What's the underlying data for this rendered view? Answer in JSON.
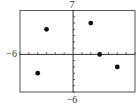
{
  "chart_data": {
    "type": "scatter",
    "title": "",
    "xlabel": "",
    "ylabel": "",
    "xlim": [
      -6,
      7
    ],
    "ylim": [
      -6,
      7
    ],
    "tick_step": 1,
    "grid": false,
    "legend": null,
    "window_labels": {
      "xmin": "−6",
      "ymax": "7",
      "ymin": "−6"
    },
    "points": [
      {
        "x": -3,
        "y": 4
      },
      {
        "x": 2,
        "y": 5
      },
      {
        "x": 3,
        "y": 0
      },
      {
        "x": 5,
        "y": -2
      },
      {
        "x": -4,
        "y": -3
      }
    ],
    "colors": {
      "axis": "#333333",
      "frame": "#555555",
      "point": "#111111"
    }
  }
}
